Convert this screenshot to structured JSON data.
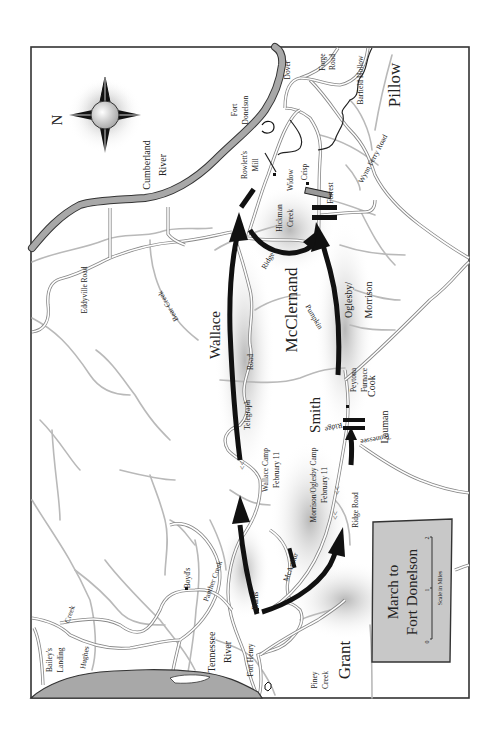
{
  "map": {
    "title": "March to Fort Donelson",
    "title_line1": "March to",
    "title_line2": "Fort Donelson",
    "orientation": "North points left (map rotated 90°)",
    "compass": {
      "label": "N"
    },
    "scale": {
      "caption": "Scale in Miles",
      "ticks": [
        "0",
        "1",
        "2"
      ]
    },
    "commanders": {
      "grant": "Grant",
      "pillow": "Pillow",
      "wallace": "Wallace",
      "mcclernand": "McClernand",
      "smith": "Smith",
      "oglesby_morrison_1": "Oglesby/",
      "oglesby_morrison_2": "Morrison",
      "cook": "Cook",
      "lauman": "Lauman",
      "forrest": "Forrest",
      "mcarthur": "McArthur"
    },
    "rivers": {
      "cumberland_1": "Cumberland",
      "cumberland_2": "River",
      "tennessee_1": "Tennessee",
      "tennessee_2": "River"
    },
    "places": {
      "fort_donelson_1": "Fort",
      "fort_donelson_2": "Donelson",
      "fort_henry": "Fort Henry",
      "dover": "Dover",
      "rowletts_mill_1": "Rowlett's",
      "rowletts_mill_2": "Mill",
      "widow_crisp_1": "Widow",
      "widow_crisp_2": "Crisp",
      "peytona_furnace_1": "Peytona",
      "peytona_furnace_2": "Furnace",
      "boyds": "Boyd's",
      "burns": "Burns'",
      "baileys_landing_1": "Bailey's",
      "baileys_landing_2": "Landing",
      "wallace_camp_1": "Wallace Camp",
      "wallace_camp_2": "February 11",
      "morrison_camp_1": "Morrison/Oglesby Camp",
      "morrison_camp_2": "February 11"
    },
    "roads": {
      "eddyville": "Eddyville Road",
      "telegraph_1": "Telegraph",
      "telegraph_2": "Road",
      "ridge_road": "Ridge Road",
      "wynn_ferry": "Wynn Ferry Road",
      "forge_1": "Forge",
      "forge_2": "Road",
      "tennessee_ridge_1": "Tennessee",
      "tennessee_ridge_2": "Ridge",
      "pumpkin_ridge_1": "Pumpkin",
      "pumpkin_ridge_2": "Ridge"
    },
    "creeks": {
      "hickman_1": "Hickman",
      "hickman_2": "Creek",
      "bear": "Bear Creek",
      "panther": "Panther Creek",
      "hughes_1": "Hughes",
      "hughes_2": "Creek",
      "piney_1": "Piney",
      "piney_2": "Creek",
      "barfield_hollow": "Barfield Hollow"
    },
    "colors": {
      "frame": "#333333",
      "river_fill": "#a8a8a8",
      "creek": "#b9b9b9",
      "march_arrow": "#111111",
      "title_box": "#c8c8c8"
    }
  }
}
